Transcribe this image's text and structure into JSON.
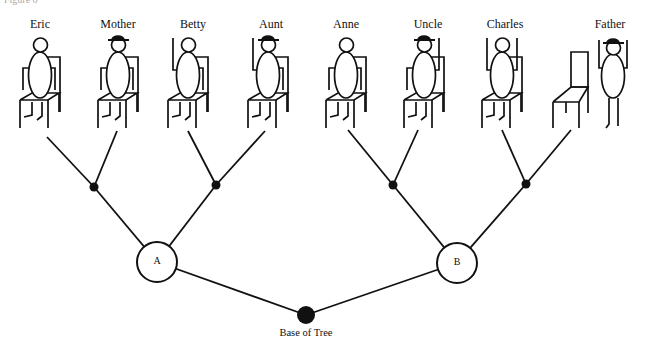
{
  "figure": {
    "caption": "Figure 6",
    "colors": {
      "ink": "#111111",
      "background": "#ffffff"
    }
  },
  "people": [
    {
      "name": "Eric",
      "x": 40,
      "hat": false,
      "arms_up": "none",
      "seated": true
    },
    {
      "name": "Mother",
      "x": 118,
      "hat": true,
      "arms_up": "none",
      "seated": true
    },
    {
      "name": "Betty",
      "x": 188,
      "hat": false,
      "arms_up": "left",
      "seated": true
    },
    {
      "name": "Aunt",
      "x": 268,
      "hat": true,
      "arms_up": "left",
      "seated": true
    },
    {
      "name": "Anne",
      "x": 346,
      "hat": false,
      "arms_up": "none",
      "seated": true
    },
    {
      "name": "Uncle",
      "x": 424,
      "hat": true,
      "arms_up": "right",
      "seated": true
    },
    {
      "name": "Charles",
      "x": 502,
      "hat": false,
      "arms_up": "both",
      "seated": true
    },
    {
      "name": "Father",
      "x": 613,
      "hat": true,
      "arms_up": "both",
      "seated": false
    }
  ],
  "tree": {
    "leaf_joins": [
      {
        "x": 94,
        "y": 187,
        "from": [
          [
            47,
            137
          ],
          [
            117,
            131
          ]
        ]
      },
      {
        "x": 216,
        "y": 185,
        "from": [
          [
            188,
            131
          ],
          [
            265,
            131
          ]
        ]
      },
      {
        "x": 393,
        "y": 185,
        "from": [
          [
            348,
            130
          ],
          [
            418,
            130
          ]
        ]
      },
      {
        "x": 526,
        "y": 184,
        "from": [
          [
            502,
            130
          ],
          [
            571,
            130
          ]
        ]
      }
    ],
    "nodes": [
      {
        "label": "A",
        "x": 157,
        "y": 262,
        "r": 20
      },
      {
        "label": "B",
        "x": 457,
        "y": 263,
        "r": 20
      }
    ],
    "base": {
      "label": "Base of Tree",
      "x": 306,
      "y": 315,
      "r": 9
    }
  }
}
